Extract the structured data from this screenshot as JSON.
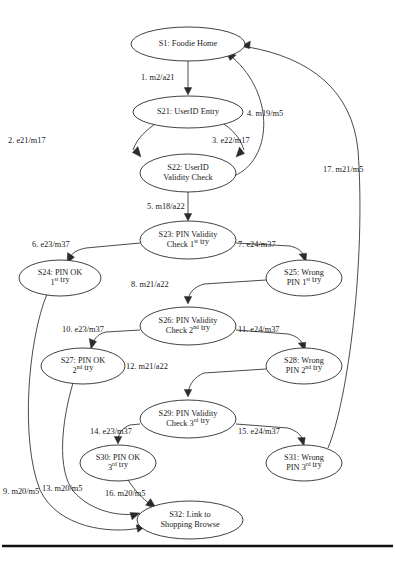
{
  "diagram": {
    "type": "state-transition-diagram",
    "background_color": "#ffffff",
    "line_color": "#2b2b2b",
    "text_color": "#1a1a1a",
    "nodes": [
      {
        "id": "S1",
        "label_lines": [
          "S1: Foodie Home"
        ],
        "cx": 188,
        "cy": 44,
        "rx": 57,
        "ry": 17
      },
      {
        "id": "S21",
        "label_lines": [
          "S21: UserID Entry"
        ],
        "cx": 188,
        "cy": 112,
        "rx": 55,
        "ry": 16
      },
      {
        "id": "S22",
        "label_lines": [
          "S22: UserID",
          "Validity Check"
        ],
        "cx": 188,
        "cy": 173,
        "rx": 48,
        "ry": 19
      },
      {
        "id": "S23",
        "label_lines": [
          "S23: PIN Validity",
          "Check 1|st| try"
        ],
        "cx": 188,
        "cy": 240,
        "rx": 48,
        "ry": 19
      },
      {
        "id": "S24",
        "label_lines": [
          "S24: PIN OK",
          "1|st| try"
        ],
        "cx": 60,
        "cy": 278,
        "rx": 41,
        "ry": 18
      },
      {
        "id": "S25",
        "label_lines": [
          "S25: Wrong",
          "PIN 1|st| try"
        ],
        "cx": 304,
        "cy": 278,
        "rx": 38,
        "ry": 18
      },
      {
        "id": "S26",
        "label_lines": [
          "S26: PIN Validity",
          "Check 2|nd| try"
        ],
        "cx": 188,
        "cy": 326,
        "rx": 48,
        "ry": 19
      },
      {
        "id": "S27",
        "label_lines": [
          "S27: PIN OK",
          "2|nd| try"
        ],
        "cx": 83,
        "cy": 366,
        "rx": 42,
        "ry": 18
      },
      {
        "id": "S28",
        "label_lines": [
          "S28: Wrong",
          "PIN 2|nd| try"
        ],
        "cx": 304,
        "cy": 366,
        "rx": 38,
        "ry": 18
      },
      {
        "id": "S29",
        "label_lines": [
          "S29: PIN Validity",
          "Check 3|rd| try"
        ],
        "cx": 188,
        "cy": 419,
        "rx": 48,
        "ry": 19
      },
      {
        "id": "S30",
        "label_lines": [
          "S30: PIN OK",
          "3|rd| try"
        ],
        "cx": 118,
        "cy": 463,
        "rx": 38,
        "ry": 18
      },
      {
        "id": "S31",
        "label_lines": [
          "S31: Wrong",
          "PIN 3|rd| try"
        ],
        "cx": 304,
        "cy": 463,
        "rx": 38,
        "ry": 18
      },
      {
        "id": "S32",
        "label_lines": [
          "S32: Link to",
          "Shopping Browse"
        ],
        "cx": 190,
        "cy": 520,
        "rx": 53,
        "ry": 19
      }
    ],
    "edges": [
      {
        "n": 1,
        "label": "1. m2/a21",
        "from": "S1",
        "to": "S21",
        "lx": 141,
        "ly": 78,
        "path": "M 188 61 L 188 92",
        "arrow": "M 188 95 L 184.2 87.5 L 191.8 87.5 Z"
      },
      {
        "n": 2,
        "label": "2. e21/m17",
        "from": "S21",
        "to": "S22",
        "lx": 8,
        "ly": 141,
        "path": "M 155 124 C 140 135 136 142 133 150",
        "arrow": "M 141 157 L 132.4 152.6 L 137.9 146.4 Z"
      },
      {
        "n": 3,
        "label": "3. e22/m17",
        "from": "S21",
        "to": "S22",
        "lx": 212,
        "ly": 141,
        "path": "M 224 124 C 238 134 241 142 244 150",
        "arrow": "M 236 157 L 239.5 147.0 L 244.6 153.6 Z"
      },
      {
        "n": 4,
        "label": "4. m19/m5",
        "from": "S22",
        "to": "S1",
        "lx": 247,
        "ly": 114,
        "path": "M 234 176 C 272 160 276 95 232 57",
        "arrow": "M 226 52 L 236.2 55.1 L 230.1 60.5 Z"
      },
      {
        "n": 5,
        "label": "5. m18/a22",
        "from": "S22",
        "to": "S23",
        "lx": 147,
        "ly": 207,
        "path": "M 188 192 L 188 217",
        "arrow": "M 188 221 L 184.2 213.5 L 191.8 213.5 Z"
      },
      {
        "n": 6,
        "label": "6. e23/m37",
        "from": "S23",
        "to": "S24",
        "lx": 32,
        "ly": 245,
        "path": "M 140 243 L 86 248 C 76 250 72 253 70 258",
        "arrow": "M 67 263 L 67.6 252.4 L 74.5 257.2 Z"
      },
      {
        "n": 7,
        "label": "7. e24/m37",
        "from": "S23",
        "to": "S25",
        "lx": 238,
        "ly": 245,
        "path": "M 236 243 L 290 246 C 298 248 302 251 304 256",
        "arrow": "M 306 262 L 299.0 254.1 L 306.6 253.2 Z"
      },
      {
        "n": 8,
        "label": "8. m21/a22",
        "from": "S25",
        "to": "S26",
        "lx": 131,
        "ly": 285,
        "path": "M 266 280 L 204 284 C 194 287 190 292 188 299",
        "arrow": "M 188 304 L 184.2 296.5 L 191.8 296.5 Z"
      },
      {
        "n": 9,
        "label": "9. m20/m5",
        "from": "S24",
        "to": "S32",
        "lx": 3,
        "ly": 492,
        "path": "M 47 294 C 28 340 20 440 40 490 C 58 528 110 534 140 528",
        "arrow": "M 146 526 L 137.8 532.3 L 136.1 524.8 Z"
      },
      {
        "n": 10,
        "label": "10. e23/m37",
        "from": "S26",
        "to": "S27",
        "lx": 62,
        "ly": 330,
        "path": "M 140 330 L 106 332 C 98 334 95 338 93 343",
        "arrow": "M 91 349 L 89.2 338.5 L 96.5 341.6 Z"
      },
      {
        "n": 11,
        "label": "11. e24/m37",
        "from": "S26",
        "to": "S28",
        "lx": 238,
        "ly": 330,
        "path": "M 236 330 L 288 334 C 297 336 301 340 303 345",
        "arrow": "M 305 351 L 298.2 343.0 L 305.8 342.3 Z"
      },
      {
        "n": 12,
        "label": "12. m21/a22",
        "from": "S28",
        "to": "S29",
        "lx": 126,
        "ly": 367,
        "path": "M 266 369 L 204 373 C 194 377 190 384 188 392",
        "arrow": "M 188 397 L 184.2 389.5 L 191.8 389.5 Z"
      },
      {
        "n": 13,
        "label": "13. m20/m5",
        "from": "S27",
        "to": "S32",
        "lx": 42,
        "ly": 489,
        "path": "M 73 383 C 62 420 56 470 74 492 C 92 512 120 516 134 514",
        "arrow": "M 140 513 L 132.1 519.8 L 130.0 512.4 Z"
      },
      {
        "n": 14,
        "label": "14. e23/m37",
        "from": "S29",
        "to": "S30",
        "lx": 90,
        "ly": 432,
        "path": "M 140 424 L 130 425 C 122 428 119 433 118 439",
        "arrow": "M 118 444 L 114.2 436.5 L 121.8 436.5 Z"
      },
      {
        "n": 15,
        "label": "15. e24/m37",
        "from": "S29",
        "to": "S31",
        "lx": 238,
        "ly": 432,
        "path": "M 236 424 L 288 428 C 297 431 301 435 303 440",
        "arrow": "M 304 446 L 297.6 437.8 L 305.2 437.4 Z"
      },
      {
        "n": 16,
        "label": "16. m20/m5",
        "from": "S30",
        "to": "S32",
        "lx": 105,
        "ly": 494,
        "path": "M 128 480 C 136 492 142 498 150 504",
        "arrow": "M 156 508 L 145.6 505.2 L 150.6 498.6 Z"
      },
      {
        "n": 17,
        "label": "17. m21/m5",
        "from": "S31",
        "to": "S1",
        "lx": 323,
        "ly": 170,
        "path": "M 328 448 C 348 400 366 260 358 150 C 352 90 310 58 248 47",
        "arrow": "M 241 46 L 250.4 41.1 L 249.5 48.7 Z"
      }
    ],
    "rule": {
      "y": 546,
      "x1": 2,
      "x2": 393
    },
    "caption_ghost": "figure caption (clipped)"
  }
}
